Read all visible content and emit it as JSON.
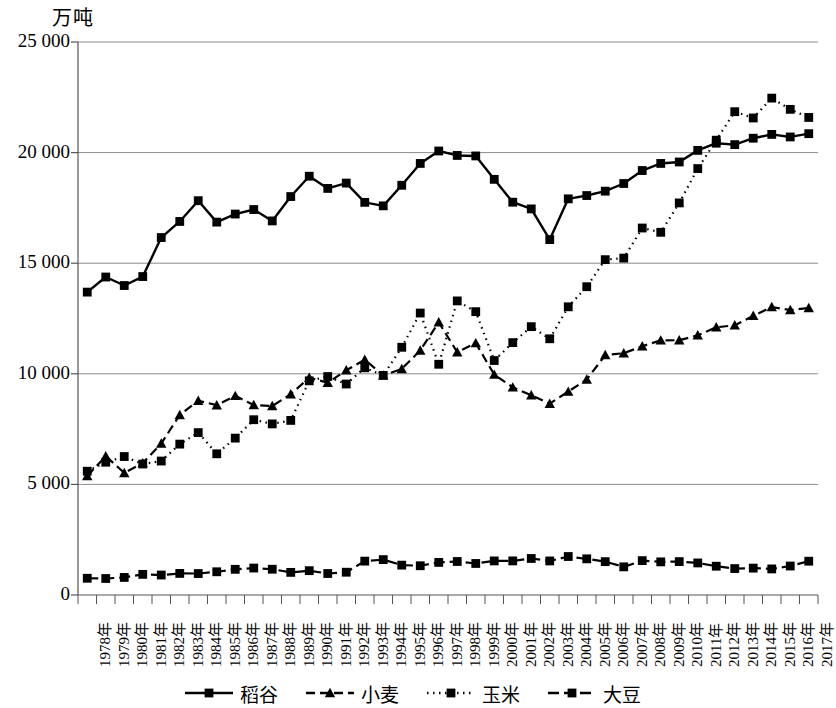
{
  "chart_data": {
    "type": "line",
    "title": "",
    "ylabel": "万吨",
    "xlabel": "",
    "ylim": [
      0,
      25000
    ],
    "yticks": [
      0,
      5000,
      10000,
      15000,
      20000,
      25000
    ],
    "ytick_labels": [
      "0",
      "5 000",
      "10 000",
      "15 000",
      "20 000",
      "25 000"
    ],
    "grid": true,
    "legend_position": "bottom",
    "categories": [
      "1978年",
      "1979年",
      "1980年",
      "1981年",
      "1982年",
      "1983年",
      "1984年",
      "1985年",
      "1986年",
      "1987年",
      "1988年",
      "1989年",
      "1990年",
      "1991年",
      "1992年",
      "1993年",
      "1994年",
      "1995年",
      "1996年",
      "1997年",
      "1998年",
      "1999年",
      "2000年",
      "2001年",
      "2002年",
      "2003年",
      "2004年",
      "2005年",
      "2006年",
      "2007年",
      "2008年",
      "2009年",
      "2010年",
      "2011年",
      "2012年",
      "2013年",
      "2014年",
      "2015年",
      "2016年",
      "2017年"
    ],
    "series": [
      {
        "name": "稻谷",
        "marker": "square",
        "line_style": "solid",
        "color": "#000000",
        "values": [
          13693,
          14375,
          13991,
          14396,
          16160,
          16887,
          17826,
          16857,
          17222,
          17426,
          16911,
          18013,
          18933,
          18381,
          18622,
          17751,
          17593,
          18523,
          19510,
          20073,
          19871,
          19849,
          18791,
          17758,
          17454,
          16066,
          17909,
          18059,
          18257,
          18603,
          19190,
          19510,
          19576,
          20100,
          20424,
          20361,
          20651,
          20823,
          20708,
          20856
        ]
      },
      {
        "name": "小麦",
        "marker": "triangle",
        "line_style": "dashed",
        "color": "#000000",
        "values": [
          5384,
          6273,
          5521,
          5964,
          6848,
          8139,
          8782,
          8581,
          9004,
          8590,
          8543,
          9081,
          9823,
          9595,
          10159,
          10639,
          9930,
          10221,
          11057,
          12329,
          10973,
          11388,
          9964,
          9387,
          9029,
          8649,
          9195,
          9745,
          10847,
          10930,
          11246,
          11512,
          11518,
          11740,
          12102,
          12193,
          12621,
          13019,
          12885,
          12977
        ]
      },
      {
        "name": "玉米",
        "marker": "square",
        "line_style": "dotted",
        "color": "#000000",
        "values": [
          5595,
          6003,
          6260,
          5921,
          6056,
          6821,
          7341,
          6383,
          7092,
          7924,
          7735,
          7893,
          9682,
          9877,
          9538,
          10270,
          9928,
          11199,
          12747,
          10431,
          13295,
          12809,
          10600,
          11409,
          12131,
          11583,
          13029,
          13937,
          15160,
          15230,
          16591,
          16397,
          17725,
          19278,
          20561,
          21849,
          21565,
          22463,
          21955,
          21589
        ]
      },
      {
        "name": "大豆",
        "marker": "square",
        "line_style": "dashdot",
        "color": "#000000",
        "values": [
          757,
          746,
          794,
          933,
          903,
          976,
          970,
          1050,
          1161,
          1218,
          1165,
          1023,
          1100,
          972,
          1030,
          1531,
          1600,
          1350,
          1322,
          1473,
          1515,
          1425,
          1541,
          1541,
          1651,
          1539,
          1740,
          1635,
          1508,
          1273,
          1554,
          1498,
          1510,
          1449,
          1301,
          1195,
          1215,
          1179,
          1310,
          1528
        ]
      }
    ]
  },
  "legend": {
    "items": [
      {
        "label": "稻谷",
        "style": "solid",
        "marker": "square"
      },
      {
        "label": "小麦",
        "style": "dashed",
        "marker": "triangle"
      },
      {
        "label": "玉米",
        "style": "dotted",
        "marker": "square"
      },
      {
        "label": "大豆",
        "style": "dashdot",
        "marker": "square"
      }
    ]
  }
}
